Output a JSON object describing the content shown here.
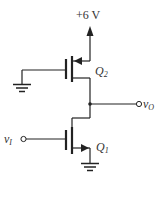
{
  "diagram": {
    "type": "circuit-schematic",
    "supply": {
      "label": "+6 V"
    },
    "transistors": [
      {
        "id": "Q2",
        "label": "Q",
        "subscript": "2",
        "type": "PMOS",
        "gate": "ground"
      },
      {
        "id": "Q1",
        "label": "Q",
        "subscript": "1",
        "type": "NMOS",
        "gate": "v_I"
      }
    ],
    "input": {
      "label": "v",
      "subscript": "I"
    },
    "output": {
      "label": "v",
      "subscript": "O"
    },
    "colors": {
      "line": "#222222",
      "background": "#ffffff"
    }
  }
}
